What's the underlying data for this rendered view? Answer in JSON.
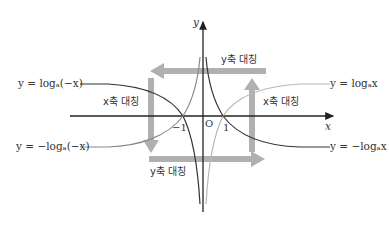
{
  "diagram": {
    "axes": {
      "x_label": "x",
      "y_label": "y",
      "origin_label": "O",
      "tick_pos": "1",
      "tick_neg": "−1"
    },
    "curves": [
      {
        "id": "log_x",
        "label": "y = logₐx",
        "color": "#b8b8b8"
      },
      {
        "id": "neg_log_x",
        "label": "y = −logₐx",
        "color": "#333333"
      },
      {
        "id": "log_neg_x",
        "label": "y = logₐ(−x)",
        "color": "#333333"
      },
      {
        "id": "neg_log_neg_x",
        "label": "y = −logₐ(−x)",
        "color": "#8a8a8a"
      }
    ],
    "symmetry_labels": {
      "top": "y축 대칭",
      "bottom": "y축 대칭",
      "left": "x축 대칭",
      "right": "x축 대칭"
    },
    "colors": {
      "axis": "#222222",
      "arrow": "#b0b0b0",
      "text": "#333333"
    }
  }
}
